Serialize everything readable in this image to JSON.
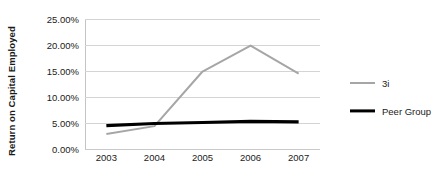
{
  "chart_data": {
    "type": "line",
    "title": "",
    "xlabel": "",
    "ylabel": "Return on Capital Employed",
    "categories": [
      "2003",
      "2004",
      "2005",
      "2006",
      "2007"
    ],
    "x_tick_labels": [
      "2003",
      "2004",
      "2005",
      "2006",
      "2007"
    ],
    "y_tick_labels": [
      "0.00%",
      "5.00%",
      "10.00%",
      "15.00%",
      "20.00%",
      "25.00%"
    ],
    "y_tick_values": [
      0,
      5,
      10,
      15,
      20,
      25
    ],
    "ylim": [
      0,
      25
    ],
    "grid": true,
    "legend_position": "right",
    "series": [
      {
        "name": "3i",
        "color": "#a6a6a6",
        "line_width": 2,
        "values": [
          2.9,
          4.4,
          14.9,
          19.9,
          14.5
        ]
      },
      {
        "name": "Peer Group",
        "color": "#000000",
        "line_width": 3.2,
        "values": [
          4.5,
          4.9,
          5.1,
          5.3,
          5.2
        ]
      }
    ]
  },
  "legend": {
    "items": [
      {
        "label": "3i"
      },
      {
        "label": "Peer Group"
      }
    ]
  },
  "colors": {
    "gridline": "#d4d4d4",
    "axis": "#c4c4c4",
    "text": "#1a1a1a",
    "background": "#ffffff"
  }
}
